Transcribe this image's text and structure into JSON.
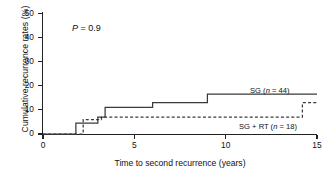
{
  "chart_data": {
    "type": "line",
    "subtype": "kaplan-meier-step",
    "title": "",
    "xlabel": "Time to second recurrence (years)",
    "ylabel": "Cumulative recurrence rates (%)",
    "xlim": [
      0,
      15
    ],
    "ylim": [
      0,
      50
    ],
    "xticks": [
      0,
      5,
      10,
      15
    ],
    "yticks": [
      0,
      10,
      20,
      30,
      40,
      50
    ],
    "xtick_labels": [
      "0",
      "5",
      "10",
      "15"
    ],
    "ytick_labels": [
      "0",
      "10",
      "20",
      "30",
      "40",
      "50"
    ],
    "grid": false,
    "legend_position": "inside-right",
    "annotations": [
      {
        "name": "p-value",
        "text_italic": "P",
        "text": " = 0.9",
        "full_text": "P = 0.9",
        "x": 1.6,
        "y": 43
      }
    ],
    "series": [
      {
        "name": "SG",
        "label": "SG (n = 44)",
        "n": 44,
        "style": "solid",
        "color": "#3a3a3a",
        "steps": [
          {
            "x": 0.0,
            "y": 0.0
          },
          {
            "x": 1.8,
            "y": 4.5
          },
          {
            "x": 3.0,
            "y": 7.0
          },
          {
            "x": 3.4,
            "y": 11.0
          },
          {
            "x": 6.0,
            "y": 13.0
          },
          {
            "x": 9.0,
            "y": 16.5
          },
          {
            "x": 15.0,
            "y": 16.5
          }
        ]
      },
      {
        "name": "SG + RT",
        "label": "SG + RT (n = 18)",
        "n": 18,
        "style": "dashed",
        "color": "#3a3a3a",
        "steps": [
          {
            "x": 0.0,
            "y": 0.0
          },
          {
            "x": 2.2,
            "y": 6.0
          },
          {
            "x": 3.2,
            "y": 7.0
          },
          {
            "x": 14.2,
            "y": 13.0
          },
          {
            "x": 15.0,
            "y": 13.0
          }
        ]
      }
    ]
  },
  "labels": {
    "ylabel": "Cumulative recurrence rates (%)",
    "xlabel": "Time to second recurrence (years)",
    "pvalue": " = 0.9",
    "pvalue_symbol": "P",
    "legend_sg": "SG (n = 44)",
    "legend_sgrt": "SG + RT (n = 18)"
  },
  "colors": {
    "axis": "#222222",
    "line": "#3a3a3a",
    "background": "#ffffff",
    "text": "#111111"
  }
}
